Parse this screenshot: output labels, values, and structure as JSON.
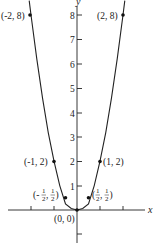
{
  "figure": {
    "function": "y = 2x^2",
    "axes": {
      "x_label": "x",
      "y_label": "y",
      "y_ticks": [
        "8",
        "7",
        "6",
        "5",
        "4",
        "3",
        "2",
        "1"
      ]
    },
    "points": [
      {
        "label": "(-2, 8)",
        "x": -2,
        "y": 8
      },
      {
        "label": "(2, 8)",
        "x": 2,
        "y": 8
      },
      {
        "label": "(-1, 2)",
        "x": -1,
        "y": 2
      },
      {
        "label": "(1, 2)",
        "x": 1,
        "y": 2
      },
      {
        "label_parts": [
          "(-",
          "1",
          "2",
          ", ",
          "1",
          "2",
          ")"
        ],
        "x": -0.5,
        "y": 0.5
      },
      {
        "label_parts": [
          "(",
          "1",
          "2",
          ", ",
          "1",
          "2",
          ")"
        ],
        "x": 0.5,
        "y": 0.5
      },
      {
        "label": "(0, 0)",
        "x": 0,
        "y": 0
      }
    ],
    "colors": {
      "ink": "#222222",
      "background": "#ffffff"
    }
  }
}
